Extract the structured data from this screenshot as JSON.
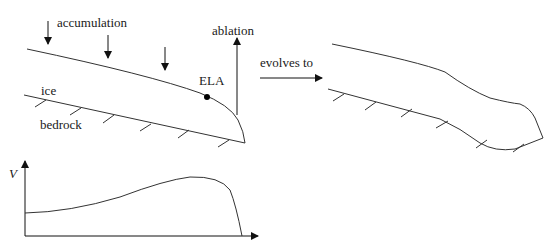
{
  "diagram": {
    "colors": {
      "stroke": "#333333",
      "text": "#1a1a1a",
      "background": "#ffffff"
    },
    "labels": {
      "accumulation": "accumulation",
      "ablation": "ablation",
      "ela": "ELA",
      "ice": "ice",
      "bedrock": "bedrock",
      "evolves_to": "evolves to",
      "velocity_axis": "V"
    },
    "panels": [
      {
        "id": "initial-glacier",
        "description": "Glacier profile with accumulation arrows, ablation arrow and ELA point"
      },
      {
        "id": "evolved-glacier",
        "description": "Evolved glacier profile with surge bulge near the terminus"
      },
      {
        "id": "velocity-profile",
        "description": "Velocity V along glacier, peaking near ELA and dropping to zero at terminus"
      }
    ]
  }
}
